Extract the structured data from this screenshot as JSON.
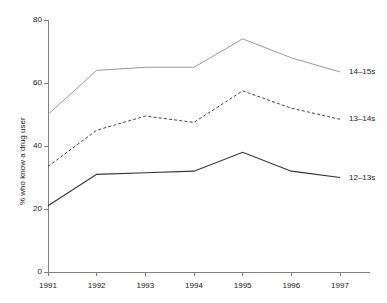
{
  "chart_data": {
    "type": "line",
    "title": "",
    "xlabel": "",
    "ylabel": "% who know a drug user",
    "categories": [
      "1991",
      "1992",
      "1993",
      "1994",
      "1995",
      "1996",
      "1997"
    ],
    "x": [
      1991,
      1992,
      1993,
      1994,
      1995,
      1996,
      1997
    ],
    "ylim": [
      0,
      80
    ],
    "yticks": [
      0,
      20,
      40,
      60,
      80
    ],
    "ytick_labels": [
      "0",
      "20",
      "40",
      "60",
      "80"
    ],
    "xtick_labels": [
      "1991",
      "1992",
      "1993",
      "1994",
      "1995",
      "1996",
      "1997"
    ],
    "grid": false,
    "legend_position": "inline-right",
    "series": [
      {
        "name": "14–15s",
        "label": "14–15s",
        "values": [
          50,
          64,
          65,
          65,
          74,
          68,
          63.5
        ],
        "color": "#999999",
        "style": "solid",
        "width": 1
      },
      {
        "name": "13–14s",
        "label": "13–14s",
        "values": [
          33.5,
          45,
          49.5,
          47.5,
          57.5,
          52,
          48.5
        ],
        "color": "#444444",
        "style": "dashed",
        "width": 1
      },
      {
        "name": "12–13s",
        "label": "12–13s",
        "values": [
          21,
          31,
          31.5,
          32,
          38,
          32,
          30
        ],
        "color": "#333333",
        "style": "solid",
        "width": 1.2
      }
    ],
    "axis_color": "#808080"
  }
}
